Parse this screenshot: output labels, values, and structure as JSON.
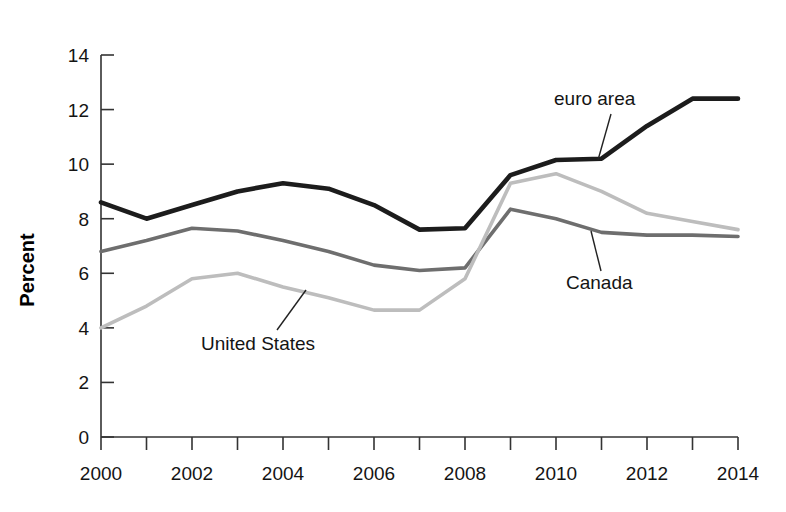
{
  "chart_data": {
    "type": "line",
    "title": "",
    "subtitle": "",
    "xlabel": "",
    "ylabel": "Percent",
    "xlim": [
      2000,
      2014
    ],
    "ylim": [
      0,
      14
    ],
    "ytick_step": 2,
    "xtick_step": 1,
    "grid": false,
    "legend_position": "inline-annotations",
    "x": [
      2000,
      2001,
      2002,
      2003,
      2004,
      2005,
      2006,
      2007,
      2008,
      2009,
      2010,
      2011,
      2012,
      2013,
      2014
    ],
    "xticks": [
      2000,
      2001,
      2002,
      2003,
      2004,
      2005,
      2006,
      2007,
      2008,
      2009,
      2010,
      2011,
      2012,
      2013,
      2014
    ],
    "xtick_labels": [
      "2000",
      "",
      "2002",
      "",
      "2004",
      "",
      "2006",
      "",
      "2008",
      "",
      "2010",
      "",
      "2012",
      "",
      "2014"
    ],
    "yticks": [
      0,
      2,
      4,
      6,
      8,
      10,
      12,
      14
    ],
    "ytick_labels": [
      "0",
      "2",
      "4",
      "6",
      "8",
      "10",
      "12",
      "14"
    ],
    "series": [
      {
        "name": "euro area",
        "color": "#1c1c1c",
        "width": 4.6,
        "values": [
          8.6,
          8.0,
          8.5,
          9.0,
          9.3,
          9.1,
          8.5,
          7.6,
          7.65,
          9.6,
          10.15,
          10.2,
          11.4,
          12.4,
          12.4
        ]
      },
      {
        "name": "Canada",
        "color": "#6e6e6e",
        "width": 3.6,
        "values": [
          6.8,
          7.2,
          7.65,
          7.55,
          7.2,
          6.8,
          6.3,
          6.1,
          6.2,
          8.35,
          8.0,
          7.5,
          7.4,
          7.4,
          7.35
        ]
      },
      {
        "name": "United States",
        "color": "#bdbdbd",
        "width": 3.6,
        "values": [
          4.0,
          4.8,
          5.8,
          6.0,
          5.5,
          5.1,
          4.65,
          4.65,
          5.8,
          9.3,
          9.65,
          9.0,
          8.2,
          7.9,
          7.6
        ]
      }
    ],
    "annotations": [
      {
        "text": "euro area",
        "series": "euro area",
        "label_x": 554,
        "label_y": 105,
        "leader_from_x": 611,
        "leader_from_y": 114,
        "leader_to_x": 598,
        "leader_to_y": 160
      },
      {
        "text": "Canada",
        "series": "Canada",
        "label_x": 566,
        "label_y": 289,
        "leader_from_x": 601,
        "leader_from_y": 271,
        "leader_to_x": 591,
        "leader_to_y": 231
      },
      {
        "text": "United States",
        "series": "United States",
        "label_x": 201,
        "label_y": 350,
        "leader_from_x": 277,
        "leader_from_y": 330,
        "leader_to_x": 306,
        "leader_to_y": 290
      }
    ]
  }
}
